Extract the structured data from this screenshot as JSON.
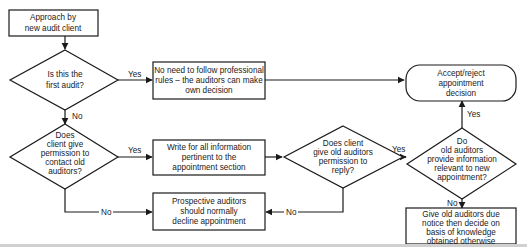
{
  "diagram": {
    "nodes": {
      "start": {
        "type": "process",
        "lines": [
          "Approach by",
          "new audit client"
        ]
      },
      "d_first_audit": {
        "type": "decision",
        "lines": [
          "Is this the",
          "first audit?"
        ]
      },
      "no_rules": {
        "type": "process",
        "lines": [
          "No need to follow professional",
          "rules – the auditors can make",
          "own decision"
        ]
      },
      "d_permission_contact": {
        "type": "decision",
        "lines": [
          "Does",
          "client give",
          "permission to",
          "contact old",
          "auditors?"
        ]
      },
      "write_info": {
        "type": "process",
        "lines": [
          "Write for all information",
          "pertinent to the",
          "appointment section"
        ]
      },
      "decline": {
        "type": "process",
        "lines": [
          "Prospective auditors",
          "should normally",
          "decline appointment"
        ]
      },
      "d_permission_reply": {
        "type": "decision",
        "lines": [
          "Does client",
          "give old auditors",
          "permission to",
          "reply?"
        ]
      },
      "d_provide_info": {
        "type": "decision",
        "lines": [
          "Do",
          "old auditors",
          "provide information",
          "relevant to new",
          "appointment?"
        ]
      },
      "accept_reject": {
        "type": "terminal",
        "lines": [
          "Accept/reject",
          "appointment",
          "decision"
        ]
      },
      "give_notice": {
        "type": "process",
        "lines": [
          "Give old auditors due",
          "notice then decide on",
          "basis of knowledge",
          "obtained otherwise"
        ]
      }
    },
    "edge_labels": {
      "first_yes": "Yes",
      "first_no": "No",
      "contact_yes": "Yes",
      "contact_no": "No",
      "reply_yes": "Yes",
      "reply_no": "No",
      "provide_yes": "Yes",
      "provide_no": "No"
    },
    "colors": {
      "stroke": "#1a1a1a",
      "fill": "#ffffff",
      "bottom_strip": "#d0d0d0"
    }
  }
}
